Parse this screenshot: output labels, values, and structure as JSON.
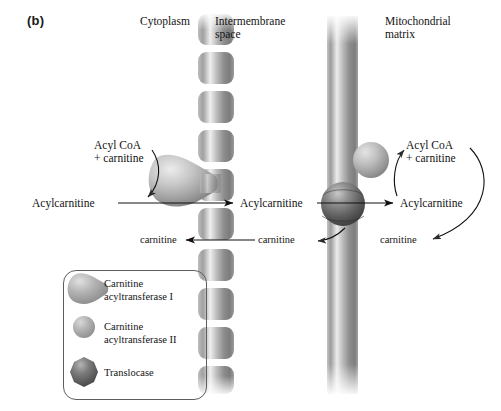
{
  "figure": {
    "panel_letter": "(b)",
    "type": "biology-diagram"
  },
  "regions": [
    {
      "id": "cytoplasm",
      "label": "Cytoplasm"
    },
    {
      "id": "intermembrane-space",
      "label": "Intermembrane\nspace",
      "line1": "Intermembrane",
      "line2": "space"
    },
    {
      "id": "mitochondrial-matrix",
      "label": "Mitochondrial\nmatrix",
      "line1": "Mitochondrial",
      "line2": "matrix"
    }
  ],
  "species": {
    "acyl_coa_carnitine_left_line1": "Acyl CoA",
    "acyl_coa_carnitine_left_line2": "+ carnitine",
    "acyl_coa_carnitine_right_line1": "Acyl CoA",
    "acyl_coa_carnitine_right_line2": "+ carnitine",
    "acylcarnitine_cytoplasm": "Acylcarnitine",
    "acylcarnitine_intermembrane": "Acylcarnitine",
    "acylcarnitine_matrix": "Acylcarnitine",
    "carnitine_cytoplasm": "carnitine",
    "carnitine_intermembrane": "carnitine",
    "carnitine_matrix": "carnitine"
  },
  "legend": {
    "items": [
      {
        "shape": "teardrop",
        "label_line1": "Carnitine",
        "label_line2": "acyltransferase I",
        "color": "#9a9a9a"
      },
      {
        "shape": "small-circle",
        "label_line1": "Carnitine",
        "label_line2": "acyltransferase II",
        "color": "#a5a5a5"
      },
      {
        "shape": "dark-octagon",
        "label_line1": "Translocase",
        "label_line2": "",
        "color": "#585858"
      }
    ]
  },
  "structures": {
    "outer_membrane": {
      "name": "outer-mitochondrial-membrane",
      "style": "segmented-cylinder-stack",
      "segments": 10
    },
    "inner_membrane": {
      "name": "inner-mitochondrial-membrane",
      "style": "continuous-bar"
    },
    "enzyme_cat1": {
      "name": "carnitine-acyltransferase-I",
      "location": "outer-membrane-cytoplasmic-face"
    },
    "enzyme_cat2": {
      "name": "carnitine-acyltransferase-II",
      "location": "inner-membrane-matrix-face"
    },
    "translocase": {
      "name": "translocase",
      "location": "inner-membrane"
    }
  },
  "colors": {
    "membrane_light": "#e8e8e8",
    "membrane_mid": "#9e9e9e",
    "membrane_dark": "#6f6f6f",
    "enzyme_light": "#d8d8d8",
    "enzyme_mid": "#9c9c9c",
    "translocase_dark": "#4a4a4a",
    "arrow": "#101010",
    "text": "#141414",
    "legend_border": "#5d5d5d",
    "background": "#ffffff"
  },
  "arrows": [
    {
      "name": "acylcoa-to-acylcarnitine-left",
      "style": "curved",
      "direction": "down"
    },
    {
      "name": "acylcarnitine-cytoplasm-to-intermembrane",
      "style": "straight",
      "direction": "right"
    },
    {
      "name": "acylcarnitine-intermembrane-to-matrix",
      "style": "straight",
      "direction": "right"
    },
    {
      "name": "carnitine-intermembrane-to-cytoplasm",
      "style": "straight",
      "direction": "left"
    },
    {
      "name": "carnitine-matrix-to-intermembrane",
      "style": "curved",
      "direction": "left"
    },
    {
      "name": "acylcarnitine-to-acylcoa-right",
      "style": "curved",
      "direction": "up"
    },
    {
      "name": "acylcoa-right-to-carnitine-matrix",
      "style": "curved-loop",
      "direction": "left"
    }
  ]
}
